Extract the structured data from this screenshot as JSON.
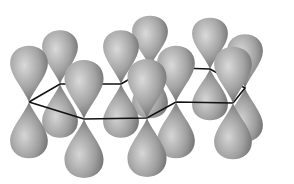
{
  "diagram": {
    "title": "",
    "colors": {
      "lobe_light": "#d4d4d4",
      "lobe_mid": "#9a9a9a",
      "lobe_dark": "#5e5e5e",
      "bond": "#111111",
      "background": "#ffffff"
    },
    "atoms": [
      {
        "id": "c1",
        "x": 29,
        "y": 102
      },
      {
        "id": "c2",
        "x": 60,
        "y": 84
      },
      {
        "id": "c3",
        "x": 121,
        "y": 84
      },
      {
        "id": "c4",
        "x": 150,
        "y": 67
      },
      {
        "id": "c5",
        "x": 210,
        "y": 69
      },
      {
        "id": "c6",
        "x": 245,
        "y": 88
      },
      {
        "id": "c7",
        "x": 233,
        "y": 103
      },
      {
        "id": "c8",
        "x": 176,
        "y": 102
      },
      {
        "id": "c9",
        "x": 147,
        "y": 118
      },
      {
        "id": "c10",
        "x": 84,
        "y": 119
      }
    ]
  }
}
